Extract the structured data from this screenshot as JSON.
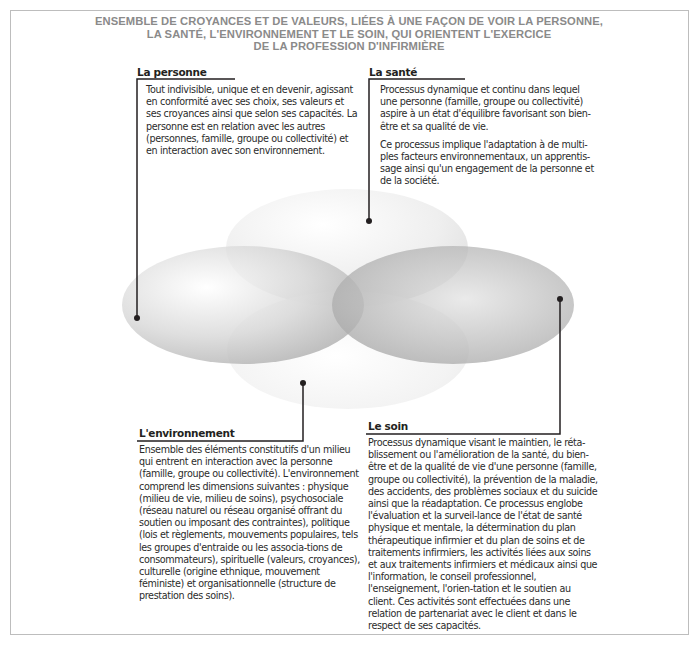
{
  "title": {
    "lines": [
      "ENSEMBLE DE CROYANCES ET DE VALEURS, LIÉES À UNE FAÇON DE VOIR LA PERSONNE,",
      "LA SANTÉ, L'ENVIRONNEMENT ET LE SOIN, QUI ORIENTENT L'EXERCICE",
      "DE LA PROFESSION D'INFIRMIÈRE"
    ]
  },
  "concepts": {
    "personne": {
      "heading": "La personne",
      "paragraphs": [
        "Tout indivisible, unique et en devenir, agissant en conformité avec ses choix, ses valeurs et ses croyances ainsi que selon ses capacités. La personne est en relation avec les autres (personnes, famille, groupe ou collectivité) et en interaction avec son environnement."
      ]
    },
    "sante": {
      "heading": "La santé",
      "paragraphs": [
        "Processus dynamique et continu dans lequel une personne (famille, groupe ou collectivité) aspire à un état d'équilibre favorisant son bien-être et sa qualité de vie.",
        "Ce processus implique l'adaptation à de multi-ples facteurs environnementaux, un apprentis-sage ainsi qu'un engagement de la personne et de la société."
      ]
    },
    "environnement": {
      "heading": "L'environnement",
      "paragraphs": [
        "Ensemble des éléments constitutifs d'un milieu qui entrent en interaction avec la personne (famille, groupe ou collectivité). L'environnement comprend les dimensions suivantes : physique (milieu de vie, milieu de soins), psychosociale (réseau naturel ou réseau organisé offrant du soutien ou imposant des contraintes), politique (lois et règlements, mouvements populaires, tels les groupes d'entraide ou les associa-tions de consommateurs), spirituelle (valeurs, croyances), culturelle (origine ethnique, mouvement féministe) et organisationnelle (structure de prestation des soins)."
      ]
    },
    "soin": {
      "heading": "Le soin",
      "paragraphs": [
        "Processus dynamique visant le maintien, le réta-blissement ou l'amélioration de la santé, du bien-être et de la qualité de vie d'une personne (famille, groupe ou collectivité), la prévention de la maladie, des accidents, des problèmes sociaux et du suicide ainsi que la réadaptation. Ce processus englobe l'évaluation et la surveil-lance de l'état de santé physique et mentale, la détermination du plan thérapeutique infirmier et du plan de soins et de traitements infirmiers, les activités liées aux soins et aux traitements infirmiers et médicaux ainsi que l'information, le conseil professionnel, l'enseignement, l'orien-tation et le soutien au client. Ces activités sont effectuées dans une relation de partenariat avec le client et dans le respect de ses capacités."
      ]
    }
  },
  "colors": {
    "title": "#8a8a8a",
    "frame": "#bdbdbd",
    "ellipse_light": "#f2f2f2",
    "ellipse_dark": "#9a9a9a",
    "connector": "#231f20"
  }
}
